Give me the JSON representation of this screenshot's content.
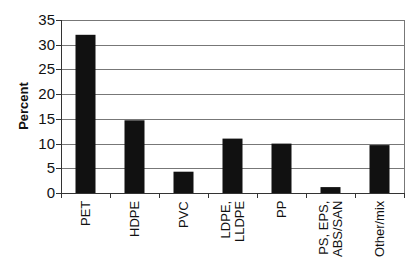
{
  "chart_data": {
    "type": "bar",
    "title": "",
    "xlabel": "",
    "ylabel": "Percent",
    "ylim": [
      0,
      35
    ],
    "yticks": [
      0,
      5,
      10,
      15,
      20,
      25,
      30,
      35
    ],
    "grid": true,
    "legend": null,
    "categories": [
      "PET",
      "HDPE",
      "PVC",
      "LDPE, LLDPE",
      "PP",
      "PS, EPS, ABS/SAN",
      "Other/mix"
    ],
    "category_lines": [
      [
        "PET"
      ],
      [
        "HDPE"
      ],
      [
        "PVC"
      ],
      [
        "LDPE,",
        "LLDPE"
      ],
      [
        "PP"
      ],
      [
        "PS, EPS,",
        "ABS/SAN"
      ],
      [
        "Other/mix"
      ]
    ],
    "values": [
      32,
      14.7,
      4.3,
      11,
      10,
      1.2,
      9.7
    ],
    "bar_color": "#111111",
    "grid_color": "#777777"
  }
}
